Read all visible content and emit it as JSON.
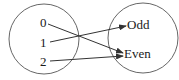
{
  "diagram": {
    "type": "function-mapping",
    "domain": {
      "name": "domain-set",
      "elements": [
        {
          "label": "0",
          "x": 43,
          "y": 23
        },
        {
          "label": "1",
          "x": 43,
          "y": 43
        },
        {
          "label": "2",
          "x": 43,
          "y": 62
        }
      ]
    },
    "codomain": {
      "name": "codomain-set",
      "elements": [
        {
          "label": "Odd",
          "x": 128,
          "y": 25
        },
        {
          "label": "Even",
          "x": 124,
          "y": 54
        }
      ]
    },
    "mappings": [
      {
        "from": "0",
        "to": "Even"
      },
      {
        "from": "1",
        "to": "Odd"
      },
      {
        "from": "2",
        "to": "Even"
      }
    ],
    "colors": {
      "stroke": "#333333",
      "text": "#1a1a1a",
      "background": "#ffffff"
    }
  }
}
